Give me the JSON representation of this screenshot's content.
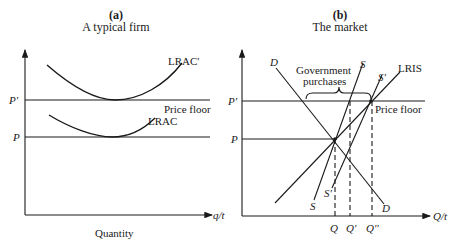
{
  "panel_a": {
    "letter": "(a)",
    "title": "A typical firm",
    "y_labels": {
      "p_prime": "P'",
      "p": "P"
    },
    "x_axis_label": "q/t",
    "x_caption": "Quantity",
    "curves": {
      "lrac_prime": "LRAC'",
      "lrac": "LRAC"
    },
    "price_floor": "Price floor"
  },
  "panel_b": {
    "letter": "(b)",
    "title": "The market",
    "y_labels": {
      "p_prime": "P'",
      "p": "P"
    },
    "x_axis_label": "Q/t",
    "x_ticks": {
      "q": "Q",
      "q_prime": "Q'",
      "q_dprime": "Q''"
    },
    "curves": {
      "d_top": "D",
      "d_bottom": "D",
      "s_top": "S",
      "s_bottom": "S",
      "s_prime_top": "S'",
      "s_prime_bottom": "S'",
      "lris": "LRIS"
    },
    "annotation": {
      "line1": "Government",
      "line2": "purchases"
    },
    "price_floor": "Price floor"
  }
}
